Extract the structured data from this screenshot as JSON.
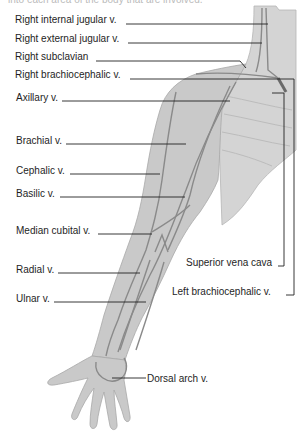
{
  "cutoff_text": "into each area of the body that are involved.",
  "labels_left": [
    {
      "id": "right-internal-jugular",
      "text": "Right internal jugular v."
    },
    {
      "id": "right-external-jugular",
      "text": "Right external jugular v."
    },
    {
      "id": "right-subclavian",
      "text": "Right subclavian"
    },
    {
      "id": "right-brachiocephalic",
      "text": "Right brachiocephalic v."
    },
    {
      "id": "axillary",
      "text": "Axillary v."
    },
    {
      "id": "brachial",
      "text": "Brachial v."
    },
    {
      "id": "cephalic",
      "text": "Cephalic v."
    },
    {
      "id": "basilic",
      "text": "Basilic v."
    },
    {
      "id": "median-cubital",
      "text": "Median cubital v."
    },
    {
      "id": "radial",
      "text": "Radial v."
    },
    {
      "id": "ulnar",
      "text": "Ulnar v."
    }
  ],
  "labels_right": [
    {
      "id": "superior-vena-cava",
      "text": "Superior vena cava"
    },
    {
      "id": "left-brachiocephalic",
      "text": "Left brachiocephalic v."
    },
    {
      "id": "dorsal-arch",
      "text": "Dorsal arch v."
    }
  ],
  "colors": {
    "body_fill": "#c9c9c9",
    "chest_fill": "#d4d4d4",
    "vein": "#8a8a8a",
    "leader": "#222222"
  }
}
